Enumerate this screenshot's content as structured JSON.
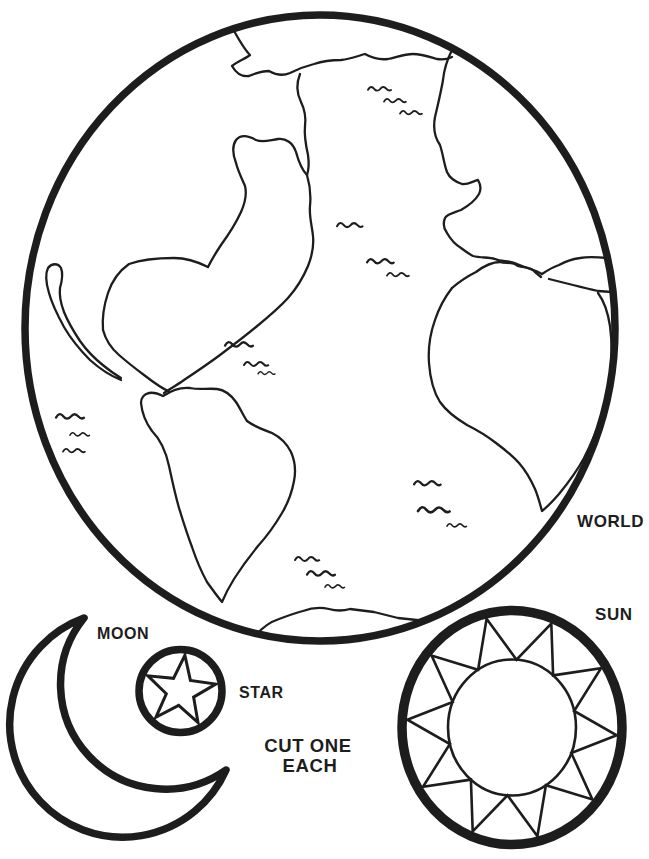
{
  "page": {
    "ink_color": "#1d1d1d",
    "paper_color": "#ffffff",
    "labels": {
      "world": "WORLD",
      "moon": "MOON",
      "star": "STAR",
      "sun": "SUN"
    },
    "instruction": {
      "line1": "CUT ONE",
      "line2": "EACH"
    },
    "shapes": [
      {
        "icon": "earth-globe-icon",
        "label": "WORLD"
      },
      {
        "icon": "crescent-moon-icon",
        "label": "MOON"
      },
      {
        "icon": "star-in-circle-icon",
        "label": "STAR"
      },
      {
        "icon": "sun-icon",
        "label": "SUN"
      }
    ]
  }
}
